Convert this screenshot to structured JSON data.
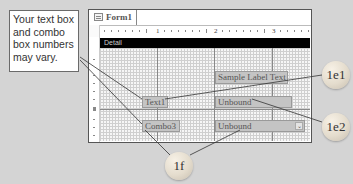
{
  "callout_note": {
    "text": "Your text box and combo box numbers may vary."
  },
  "form_window": {
    "tab_label": "Form1",
    "icon": "form-icon",
    "section_label": "Detail",
    "ruler_numbers": [
      "1",
      "2",
      "3"
    ]
  },
  "controls": {
    "label": {
      "text": "Sample Label Text"
    },
    "textbox_label": {
      "text": "Text1"
    },
    "textbox": {
      "text": "Unbound"
    },
    "combo_label": {
      "text": "Combo3"
    },
    "combo": {
      "text": "Unbound",
      "dropdown_glyph": "⌄"
    }
  },
  "step_callouts": [
    {
      "id": "1e1",
      "label": "1e1"
    },
    {
      "id": "1e2",
      "label": "1e2"
    },
    {
      "id": "1f",
      "label": "1f"
    }
  ],
  "colors": {
    "background": "#d4d4d4",
    "detail_bar": "#000000",
    "control_fill": "#c4c4c4",
    "bubble": "#e4dccd"
  }
}
